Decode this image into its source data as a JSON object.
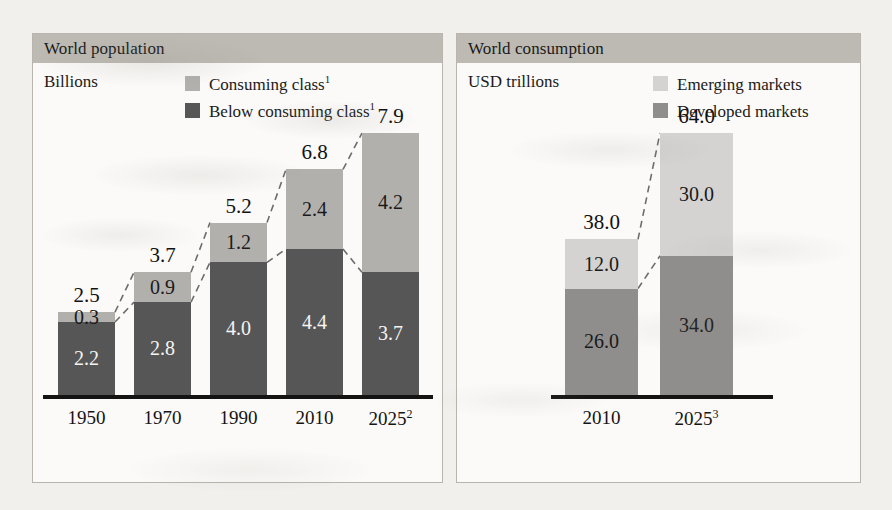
{
  "colors": {
    "page_background": "#f2f0ec",
    "panel_background": "#fbfaf8",
    "panel_border": "#b9b5ae",
    "header_background": "#bdbab4",
    "axis": "#141414",
    "pop_light_segment": "#b2b0ad",
    "pop_dark_segment": "#565656",
    "cons_light_segment": "#d4d3d1",
    "cons_mid_segment": "#8f8e8c",
    "connector_line": "#6e6c69"
  },
  "panels": {
    "left": {
      "title": "World population",
      "unit": "Billions",
      "legend": [
        {
          "label": "Consuming class",
          "sup": "1",
          "color": "#b2b0ad"
        },
        {
          "label": "Below consuming class",
          "sup": "1",
          "color": "#565656"
        }
      ]
    },
    "right": {
      "title": "World consumption",
      "unit": "USD trillions",
      "legend": [
        {
          "label": "Emerging markets",
          "sup": "",
          "color": "#d4d3d1"
        },
        {
          "label": "Developed markets",
          "sup": "",
          "color": "#8f8e8c"
        }
      ]
    }
  },
  "chart_data": [
    {
      "type": "bar",
      "title": "World population",
      "subtitle": "Billions",
      "ylabel": "Billions",
      "xlabel": "",
      "stacked": true,
      "grid": false,
      "legend_position": "top-right",
      "ylim": [
        0,
        7.9
      ],
      "categories": [
        "1950",
        "1970",
        "1990",
        "2010",
        "2025"
      ],
      "category_superscripts": [
        "",
        "",
        "",
        "",
        "2"
      ],
      "series": [
        {
          "name": "Below consuming class",
          "values": [
            2.2,
            2.8,
            4.0,
            4.4,
            3.7
          ],
          "color": "#565656"
        },
        {
          "name": "Consuming class",
          "values": [
            0.3,
            0.9,
            1.2,
            2.4,
            4.2
          ],
          "color": "#b2b0ad"
        }
      ],
      "totals": [
        2.5,
        3.7,
        5.2,
        6.8,
        7.9
      ]
    },
    {
      "type": "bar",
      "title": "World consumption",
      "subtitle": "USD trillions",
      "ylabel": "USD trillions",
      "xlabel": "",
      "stacked": true,
      "grid": false,
      "legend_position": "top-right",
      "ylim": [
        0,
        64.0
      ],
      "categories": [
        "2010",
        "2025"
      ],
      "category_superscripts": [
        "",
        "3"
      ],
      "series": [
        {
          "name": "Developed markets",
          "values": [
            26.0,
            34.0
          ],
          "color": "#8f8e8c"
        },
        {
          "name": "Emerging markets",
          "values": [
            12.0,
            30.0
          ],
          "color": "#d4d3d1"
        }
      ],
      "totals": [
        38.0,
        64.0
      ]
    }
  ]
}
